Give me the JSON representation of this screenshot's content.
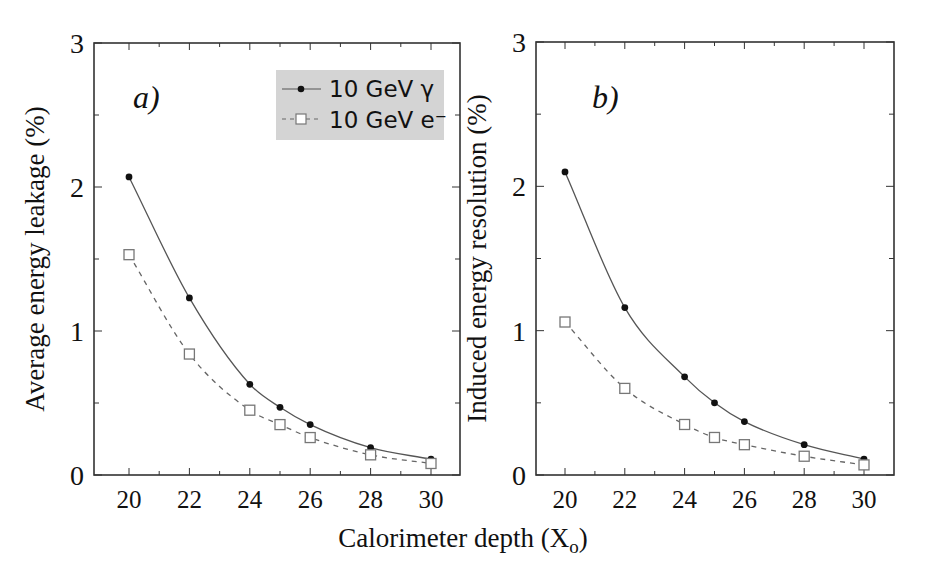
{
  "figure": {
    "xlabel": "Calorimeter depth (X",
    "xlabel_sub": "o",
    "xlabel_close": ")"
  },
  "legend": {
    "items": [
      {
        "label": "10 GeV γ",
        "marker": "filled-circle",
        "line": "solid"
      },
      {
        "label": "10 GeV e⁻",
        "marker": "open-square",
        "line": "dashed"
      }
    ],
    "background": "#d4d4d4"
  },
  "colors": {
    "line": "#555555",
    "marker_fill": "#111111",
    "frame": "#333333",
    "open_marker_stroke": "#777777"
  },
  "chart_data": [
    {
      "type": "line",
      "panel_label": "a)",
      "title": "",
      "xlabel": "Calorimeter depth (Xo)",
      "ylabel": "Average energy leakage (%)",
      "x": [
        20,
        22,
        24,
        25,
        26,
        28,
        30
      ],
      "xticks": [
        20,
        22,
        24,
        26,
        28,
        30
      ],
      "yticks": [
        0,
        1,
        2,
        3
      ],
      "xlim": [
        19,
        31
      ],
      "ylim": [
        0,
        3
      ],
      "grid": false,
      "legend_position": "upper right",
      "series": [
        {
          "name": "10 GeV γ",
          "values": [
            2.07,
            1.23,
            0.63,
            0.47,
            0.35,
            0.19,
            0.11
          ],
          "style": "solid",
          "marker": "filled-circle"
        },
        {
          "name": "10 GeV e⁻",
          "values": [
            1.53,
            0.84,
            0.45,
            0.35,
            0.26,
            0.14,
            0.08
          ],
          "style": "dashed",
          "marker": "open-square"
        }
      ]
    },
    {
      "type": "line",
      "panel_label": "b)",
      "title": "",
      "xlabel": "Calorimeter depth (Xo)",
      "ylabel": "Induced energy resolution (%)",
      "x": [
        20,
        22,
        24,
        25,
        26,
        28,
        30
      ],
      "xticks": [
        20,
        22,
        24,
        26,
        28,
        30
      ],
      "yticks": [
        0,
        1,
        2,
        3
      ],
      "xlim": [
        19,
        31
      ],
      "ylim": [
        0,
        3
      ],
      "grid": false,
      "series": [
        {
          "name": "10 GeV γ",
          "values": [
            2.1,
            1.16,
            0.68,
            0.5,
            0.37,
            0.21,
            0.11
          ],
          "style": "solid",
          "marker": "filled-circle"
        },
        {
          "name": "10 GeV e⁻",
          "values": [
            1.06,
            0.6,
            0.35,
            0.26,
            0.21,
            0.13,
            0.07
          ],
          "style": "dashed",
          "marker": "open-square"
        }
      ]
    }
  ]
}
